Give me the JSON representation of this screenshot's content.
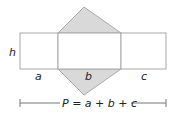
{
  "diagram": {
    "labels": {
      "height": "h",
      "side_a": "a",
      "side_b": "b",
      "side_c": "c"
    },
    "formula": "P = a + b + c",
    "colors": {
      "face_fill": "#ffffff",
      "triangle_fill": "#d9d9d9",
      "stroke": "#a8a8a8",
      "text": "#222222"
    }
  }
}
